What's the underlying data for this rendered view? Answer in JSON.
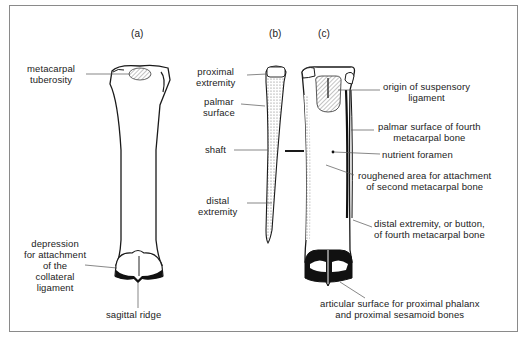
{
  "figure": {
    "panels": [
      {
        "id": "a",
        "label": "(a)"
      },
      {
        "id": "b",
        "label": "(b)"
      },
      {
        "id": "c",
        "label": "(c)"
      }
    ],
    "labels": {
      "metacarpal_tuberosity": [
        "metacarpal",
        "tuberosity"
      ],
      "depression_collateral": [
        "depression",
        "for attachment",
        "of the",
        "collateral",
        "ligament"
      ],
      "sagittal_ridge": "sagittal ridge",
      "proximal_extremity": [
        "proximal",
        "extremity"
      ],
      "palmar_surface": [
        "palmar",
        "surface"
      ],
      "shaft": "shaft",
      "distal_extremity": [
        "distal",
        "extremity"
      ],
      "origin_suspensory": [
        "origin of suspensory",
        "ligament"
      ],
      "palmar_surface_fourth": [
        "palmar surface of fourth",
        "metacarpal bone"
      ],
      "nutrient_foramen": "nutrient foramen",
      "roughened_area": [
        "roughened area for attachment",
        "of second metacarpal bone"
      ],
      "distal_extremity_button": [
        "distal extremity, or button,",
        "of fourth metacarpal bone"
      ],
      "articular_surface": [
        "articular surface for proximal phalanx",
        "and proximal sesamoid bones"
      ]
    },
    "colors": {
      "line": "#1a1a1a",
      "frame": "#8a8a8a",
      "leader": "#555555",
      "stipple": "#9a9a9a"
    }
  }
}
